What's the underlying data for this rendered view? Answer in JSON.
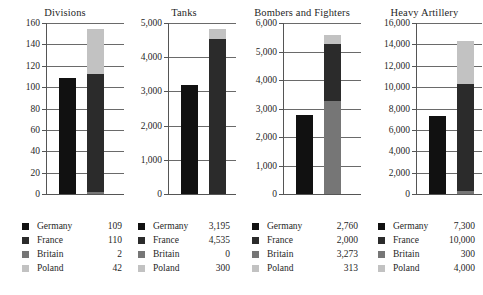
{
  "chart_data": {
    "type": "bar",
    "title": "",
    "layout": "small-multiples",
    "panels": 4,
    "orientation": "vertical",
    "grid": true,
    "legend_position": "below each panel",
    "series_names": [
      "Germany",
      "France",
      "Britain",
      "Poland"
    ],
    "series_colors": [
      "#111111",
      "#2b2b2b",
      "#767676",
      "#c2c2c2"
    ],
    "bar_groups": [
      "Germany",
      "Allies"
    ],
    "charts": [
      {
        "title": "Divisions",
        "categories": [
          "Germany",
          "France",
          "Britain",
          "Poland"
        ],
        "values": [
          109,
          110,
          2,
          42
        ],
        "value_labels": [
          "109",
          "110",
          "2",
          "42"
        ],
        "ylim": [
          0,
          160
        ],
        "yticks": [
          0,
          20,
          40,
          60,
          80,
          100,
          120,
          140,
          160
        ],
        "ytick_labels": [
          "0",
          "20",
          "40",
          "60",
          "80",
          "100",
          "120",
          "140",
          "160"
        ],
        "germany_total": 109,
        "allied_stack_order": [
          "Britain",
          "France",
          "Poland"
        ],
        "allied_stack_values": [
          2,
          110,
          42
        ],
        "allied_total": 154,
        "xlabel": "",
        "ylabel": ""
      },
      {
        "title": "Tanks",
        "categories": [
          "Germany",
          "France",
          "Britain",
          "Poland"
        ],
        "values": [
          3195,
          4535,
          0,
          300
        ],
        "value_labels": [
          "3,195",
          "4,535",
          "0",
          "300"
        ],
        "ylim": [
          0,
          5000
        ],
        "yticks": [
          0,
          1000,
          2000,
          3000,
          4000,
          5000
        ],
        "ytick_labels": [
          "0",
          "1,000",
          "2,000",
          "3,000",
          "4,000",
          "5,000"
        ],
        "germany_total": 3195,
        "allied_stack_order": [
          "Britain",
          "France",
          "Poland"
        ],
        "allied_stack_values": [
          0,
          4535,
          300
        ],
        "allied_total": 4835,
        "xlabel": "",
        "ylabel": ""
      },
      {
        "title": "Bombers and Fighters",
        "categories": [
          "Germany",
          "France",
          "Britain",
          "Poland"
        ],
        "values": [
          2760,
          2000,
          3273,
          313
        ],
        "value_labels": [
          "2,760",
          "2,000",
          "3,273",
          "313"
        ],
        "ylim": [
          0,
          6000
        ],
        "yticks": [
          0,
          1000,
          2000,
          3000,
          4000,
          5000,
          6000
        ],
        "ytick_labels": [
          "0",
          "1,000",
          "2,000",
          "3,000",
          "4,000",
          "5,000",
          "6,000"
        ],
        "germany_total": 2760,
        "allied_stack_order": [
          "Britain",
          "France",
          "Poland"
        ],
        "allied_stack_values": [
          3273,
          2000,
          313
        ],
        "allied_total": 5586,
        "xlabel": "",
        "ylabel": ""
      },
      {
        "title": "Heavy Artillery",
        "categories": [
          "Germany",
          "France",
          "Britain",
          "Poland"
        ],
        "values": [
          7300,
          10000,
          300,
          4000
        ],
        "value_labels": [
          "7,300",
          "10,000",
          "300",
          "4,000"
        ],
        "ylim": [
          0,
          16000
        ],
        "yticks": [
          0,
          2000,
          4000,
          6000,
          8000,
          10000,
          12000,
          14000,
          16000
        ],
        "ytick_labels": [
          "0",
          "2,000",
          "4,000",
          "6,000",
          "8,000",
          "10,000",
          "12,000",
          "14,000",
          "16,000"
        ],
        "germany_total": 7300,
        "allied_stack_order": [
          "Britain",
          "France",
          "Poland"
        ],
        "allied_stack_values": [
          300,
          10000,
          4000
        ],
        "allied_total": 14300,
        "xlabel": "",
        "ylabel": ""
      }
    ]
  },
  "panels": [
    {
      "title": "Divisions",
      "legend": [
        {
          "name": "Germany",
          "value": "109"
        },
        {
          "name": "France",
          "value": "110"
        },
        {
          "name": "Britain",
          "value": "2"
        },
        {
          "name": "Poland",
          "value": "42"
        }
      ]
    },
    {
      "title": "Tanks",
      "legend": [
        {
          "name": "Germany",
          "value": "3,195"
        },
        {
          "name": "France",
          "value": "4,535"
        },
        {
          "name": "Britain",
          "value": "0"
        },
        {
          "name": "Poland",
          "value": "300"
        }
      ]
    },
    {
      "title": "Bombers and Fighters",
      "legend": [
        {
          "name": "Germany",
          "value": "2,760"
        },
        {
          "name": "France",
          "value": "2,000"
        },
        {
          "name": "Britain",
          "value": "3,273"
        },
        {
          "name": "Poland",
          "value": "313"
        }
      ]
    },
    {
      "title": "Heavy Artillery",
      "legend": [
        {
          "name": "Germany",
          "value": "7,300"
        },
        {
          "name": "France",
          "value": "10,000"
        },
        {
          "name": "Britain",
          "value": "300"
        },
        {
          "name": "Poland",
          "value": "4,000"
        }
      ]
    }
  ]
}
